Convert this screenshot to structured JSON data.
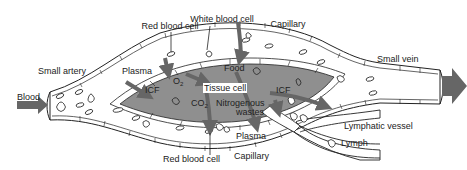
{
  "diagram": {
    "type": "capillary-exchange",
    "colors": {
      "tissue_fill": "#8f8f8f",
      "arrow": "#666666",
      "vessel_fill": "#ffffff",
      "outline": "#222222"
    },
    "labels": {
      "red_blood_cell_top": "Red blood cell",
      "white_blood_cell": "White blood cell",
      "capillary_top": "Capillary",
      "small_artery": "Small artery",
      "small_vein": "Small vein",
      "plasma_top": "Plasma",
      "food": "Food",
      "blood": "Blood",
      "icf_left": "ICF",
      "o2": "O",
      "o2_sub": "2",
      "tissue_cell": "Tissue cell",
      "icf_right": "ICF",
      "co2": "CO",
      "co2_sub": "2",
      "nitrogenous": "Nitrogenous",
      "wastes": "wastes",
      "lymphatic_vessel": "Lymphatic vessel",
      "lymph": "Lymph",
      "plasma_bottom": "Plasma",
      "red_blood_cell_bottom": "Red blood cell",
      "capillary_bottom": "Capillary"
    }
  }
}
